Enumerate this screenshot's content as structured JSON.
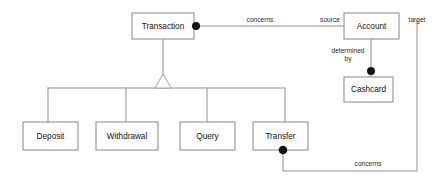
{
  "diagram": {
    "kind": "uml-class-diagram",
    "canvas": {
      "width": 436,
      "height": 186
    },
    "colors": {
      "background": "#ffffff",
      "box_fill": "#ffffff",
      "box_stroke": "#878787",
      "line_stroke": "#8f8f8f",
      "dot_fill": "#141414",
      "text": "#111111"
    },
    "classes": [
      {
        "id": "transaction",
        "label": "Transaction",
        "x": 132,
        "y": 13,
        "w": 62,
        "h": 26
      },
      {
        "id": "account",
        "label": "Account",
        "x": 344,
        "y": 13,
        "w": 55,
        "h": 26
      },
      {
        "id": "cashcard",
        "label": "Cashcard",
        "x": 344,
        "y": 77,
        "w": 49,
        "h": 25
      },
      {
        "id": "deposit",
        "label": "Deposit",
        "x": 23,
        "y": 122,
        "w": 55,
        "h": 28
      },
      {
        "id": "withdrawal",
        "label": "Withdrawal",
        "x": 96,
        "y": 122,
        "w": 62,
        "h": 28
      },
      {
        "id": "query",
        "label": "Query",
        "x": 180,
        "y": 122,
        "w": 55,
        "h": 28
      },
      {
        "id": "transfer",
        "label": "Transfer",
        "x": 253,
        "y": 122,
        "w": 55,
        "h": 28
      }
    ],
    "association_labels": [
      {
        "id": "concerns-top",
        "text": "concerns",
        "x": 260,
        "y": 20
      },
      {
        "id": "source",
        "text": "source",
        "x": 330,
        "y": 20
      },
      {
        "id": "target",
        "text": "target",
        "x": 417,
        "y": 20
      },
      {
        "id": "determined",
        "text": "determined",
        "x": 348,
        "y": 51
      },
      {
        "id": "by",
        "text": "by",
        "x": 348,
        "y": 59
      },
      {
        "id": "concerns-bot",
        "text": "concerns",
        "x": 368,
        "y": 164
      }
    ],
    "subclasses": [
      "Deposit",
      "Withdrawal",
      "Query",
      "Transfer"
    ],
    "superclass": "Transaction",
    "associations": [
      {
        "from": "Transaction",
        "to": "Account",
        "label": "concerns",
        "roles": [
          "source"
        ],
        "aggregation_end": "Transaction"
      },
      {
        "from": "Account",
        "to": "Cashcard",
        "label": "determined by",
        "aggregation_end": "Cashcard"
      },
      {
        "from": "Transfer",
        "to": "Account",
        "label": "concerns",
        "roles": [
          "target"
        ],
        "aggregation_end": "Transfer"
      }
    ]
  }
}
